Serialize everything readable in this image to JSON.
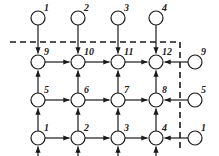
{
  "figure": {
    "kind": "directed-grid-network-diagram",
    "width": 219,
    "height": 156,
    "background": "#ffffff",
    "stroke_color": "#1a1a1a",
    "node_fill": "#ffffff",
    "node_radius": 7,
    "stroke_width": 1.2,
    "dashed_stroke_width": 1.6,
    "dash_pattern": "6,4"
  },
  "grid": {
    "columns_x": [
      38,
      78,
      118,
      156
    ],
    "rows_y": [
      62,
      100,
      138
    ],
    "top_source_y": 18,
    "right_source_x": 195,
    "dashed_horizontal_y": 42,
    "dashed_horizontal_x_start": 10,
    "dashed_horizontal_x_end": 180,
    "dashed_vertical_x": 180,
    "dashed_vertical_y_start": 42,
    "dashed_vertical_y_end": 152
  },
  "nodes": {
    "top_sources": [
      {
        "label": "1",
        "x": 38,
        "y": 18
      },
      {
        "label": "2",
        "x": 78,
        "y": 18
      },
      {
        "label": "3",
        "x": 118,
        "y": 18
      },
      {
        "label": "4",
        "x": 156,
        "y": 18
      }
    ],
    "grid_row_top": [
      {
        "label": "9",
        "x": 38,
        "y": 62
      },
      {
        "label": "10",
        "x": 78,
        "y": 62
      },
      {
        "label": "11",
        "x": 118,
        "y": 62
      },
      {
        "label": "12",
        "x": 156,
        "y": 62
      }
    ],
    "grid_row_middle": [
      {
        "label": "5",
        "x": 38,
        "y": 100
      },
      {
        "label": "6",
        "x": 78,
        "y": 100
      },
      {
        "label": "7",
        "x": 118,
        "y": 100
      },
      {
        "label": "8",
        "x": 156,
        "y": 100
      }
    ],
    "grid_row_bottom": [
      {
        "label": "1",
        "x": 38,
        "y": 138
      },
      {
        "label": "2",
        "x": 78,
        "y": 138
      },
      {
        "label": "3",
        "x": 118,
        "y": 138
      },
      {
        "label": "4",
        "x": 156,
        "y": 138
      }
    ],
    "right_sources": [
      {
        "label": "9",
        "x": 195,
        "y": 62
      },
      {
        "label": "5",
        "x": 195,
        "y": 100
      },
      {
        "label": "1",
        "x": 195,
        "y": 138
      }
    ]
  },
  "labels": {
    "top_sources": [
      "1",
      "2",
      "3",
      "4"
    ],
    "row_top": [
      "9",
      "10",
      "11",
      "12"
    ],
    "row_middle": [
      "5",
      "6",
      "7",
      "8"
    ],
    "row_bottom": [
      "1",
      "2",
      "3",
      "4"
    ],
    "right_sources": [
      "9",
      "5",
      "1"
    ]
  },
  "edges": {
    "horizontal_direction": "rightward",
    "vertical_direction_interior": "upward",
    "top_injection_direction": "downward",
    "right_injection_direction": "leftward"
  }
}
